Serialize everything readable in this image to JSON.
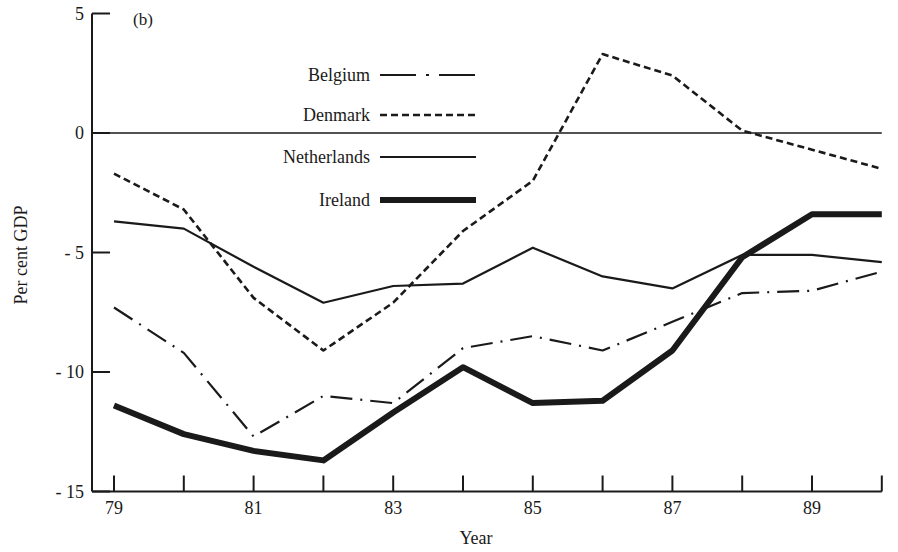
{
  "chart_data": {
    "type": "line",
    "title": "",
    "panel_label": "(b)",
    "xlabel": "Year",
    "ylabel": "Per cent GDP",
    "x": [
      79,
      80,
      81,
      82,
      83,
      84,
      85,
      86,
      87,
      88,
      89,
      90
    ],
    "x_tick_labels": [
      "79",
      "",
      "81",
      "",
      "83",
      "",
      "85",
      "",
      "87",
      "",
      "89",
      ""
    ],
    "y_ticks": [
      5,
      0,
      -5,
      -10,
      -15
    ],
    "y_tick_labels": [
      "5",
      "0",
      "- 5",
      "- 10",
      "- 15"
    ],
    "ylim": [
      -15,
      5
    ],
    "xlim": [
      79,
      90
    ],
    "grid": false,
    "zero_line": true,
    "legend_position": "upper-left-inside",
    "series": [
      {
        "name": "Belgium",
        "style": "dash-dot",
        "width": 2.2,
        "values": [
          -7.3,
          -9.2,
          -12.7,
          -11.0,
          -11.3,
          -9.0,
          -8.5,
          -9.1,
          -7.9,
          -6.7,
          -6.6,
          -5.8
        ]
      },
      {
        "name": "Denmark",
        "style": "dashed",
        "width": 2.6,
        "values": [
          -1.7,
          -3.2,
          -6.9,
          -9.1,
          -7.1,
          -4.1,
          -2.0,
          3.3,
          2.4,
          0.1,
          -0.7,
          -1.5
        ]
      },
      {
        "name": "Netherlands",
        "style": "solid",
        "width": 2.2,
        "values": [
          -3.7,
          -4.0,
          -5.6,
          -7.1,
          -6.4,
          -6.3,
          -4.8,
          -6.0,
          -6.5,
          -5.1,
          -5.1,
          -5.4
        ]
      },
      {
        "name": "Ireland",
        "style": "solid-thick",
        "width": 6,
        "values": [
          -11.4,
          -12.6,
          -13.3,
          -13.7,
          -11.7,
          -9.8,
          -11.3,
          -11.2,
          -9.1,
          -5.2,
          -3.4,
          -3.4
        ]
      }
    ]
  },
  "colors": {
    "ink": "#1a1a1a",
    "background": "#ffffff"
  }
}
